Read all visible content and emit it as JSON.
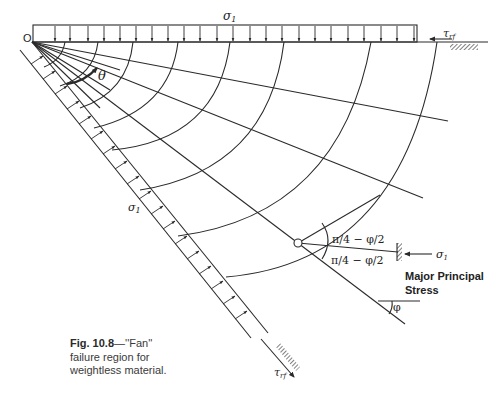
{
  "figure": {
    "origin_label": "O",
    "top_load_label": "σ",
    "top_load_subscript": "1",
    "side_load_label": "σ",
    "side_load_subscript": "1",
    "top_shear_label": "τ",
    "top_shear_subscript": "rf",
    "bottom_shear_label": "τ",
    "bottom_shear_subscript": "rf",
    "fan_angle_label": "θ",
    "upper_angle_label": "π/4 − φ/2",
    "lower_angle_label": "π/4 − φ/2",
    "stress_label": "σ",
    "stress_subscript": "1",
    "stress_caption_line1": "Major Principal",
    "stress_caption_line2": "Stress",
    "friction_angle_label": "φ"
  },
  "caption": {
    "fig_number": "Fig. 10.8",
    "dash": "—",
    "title_quoted": "''Fan''",
    "line2": "failure region for",
    "line3": "weightless material."
  },
  "colors": {
    "ink": "#2a2a2a",
    "background": "#ffffff"
  }
}
